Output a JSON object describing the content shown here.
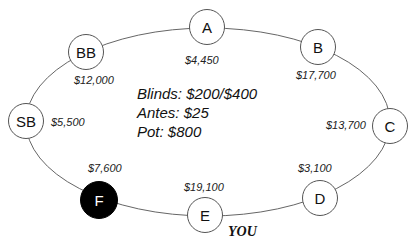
{
  "table": {
    "stroke_color": "#666666",
    "seats": [
      {
        "label": "A",
        "stack": "$4,450"
      },
      {
        "label": "B",
        "stack": "$17,700"
      },
      {
        "label": "C",
        "stack": "$13,700"
      },
      {
        "label": "D",
        "stack": "$3,100"
      },
      {
        "label": "E",
        "stack": "$19,100"
      },
      {
        "label": "F",
        "stack": "$7,600"
      },
      {
        "label": "SB",
        "stack": "$5,500"
      },
      {
        "label": "BB",
        "stack": "$12,000"
      }
    ],
    "hero_seat": "E",
    "hero_label": "YOU",
    "highlighted_seat": "F",
    "highlight_color": "#000000"
  },
  "info": {
    "blinds": "Blinds: $200/$400",
    "antes": "Antes: $25",
    "pot": "Pot: $800"
  }
}
